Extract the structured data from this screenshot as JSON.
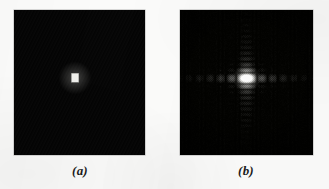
{
  "figure": {
    "background_color": "#fbfbfa",
    "panel_border_color": "#787878",
    "panel_background_color": "#050505"
  },
  "panels": [
    {
      "id": "a",
      "caption": "(a)",
      "title": "Simple image of a centered white rectangle on a black background",
      "kind": "spatial-domain-image",
      "frame": {
        "x": 14,
        "y": 10,
        "width": 131,
        "height": 145
      },
      "chart_data": {
        "type": "heatmap",
        "title": "Simple image (rectangle)",
        "xlabel": "",
        "ylabel": "",
        "colormap": "grayscale",
        "value_range": [
          0,
          1
        ],
        "grid": false,
        "legend": "none",
        "description": "Uniform black field containing one small bright white rectangle slightly above and left of the geometric center.",
        "rectangle": {
          "center_x_fraction": 0.466,
          "center_y_fraction": 0.468,
          "width_fraction": 0.053,
          "height_fraction": 0.06,
          "fill_value": 1.0,
          "fill_color": "#f0f0ec"
        },
        "background_value": 0.02,
        "background_color": "#050505"
      }
    },
    {
      "id": "b",
      "caption": "(b)",
      "title": "Fourier spectrum magnitude of the rectangle, centered, displayed with a log transform",
      "kind": "frequency-domain-spectrum",
      "frame": {
        "x": 180,
        "y": 10,
        "width": 133,
        "height": 145
      },
      "chart_data": {
        "type": "heatmap",
        "title": "Fourier spectrum (2-D sinc)",
        "xlabel": "u",
        "ylabel": "v",
        "colormap": "grayscale",
        "value_range": [
          0,
          1
        ],
        "grid": false,
        "legend": "none",
        "description": "Centered 2-D sinc magnitude: one dominant bright central lobe with decaying periodic side lobes forming a cross along the horizontal and vertical frequency axes.",
        "function": "abs(sinc(a*u) * sinc(b*v)) with log scaling",
        "center_x_fraction": 0.5,
        "center_y_fraction": 0.47,
        "horizontal_lobe_half_width_px": 10.5,
        "vertical_lobe_half_width_px": 5.6,
        "log_scale_constant": 22,
        "center_lobe_peak_value": 1.0,
        "horizontal_side_lobe_peaks": [
          0.215,
          0.128,
          0.091,
          0.071,
          0.058
        ],
        "vertical_side_lobe_peaks": [
          0.215,
          0.128,
          0.091,
          0.071,
          0.058,
          0.049,
          0.043,
          0.038
        ],
        "halftone_screen": true,
        "halftone_period_px": 2.0
      }
    }
  ],
  "captions": {
    "a": "(a)",
    "b": "(b)"
  }
}
